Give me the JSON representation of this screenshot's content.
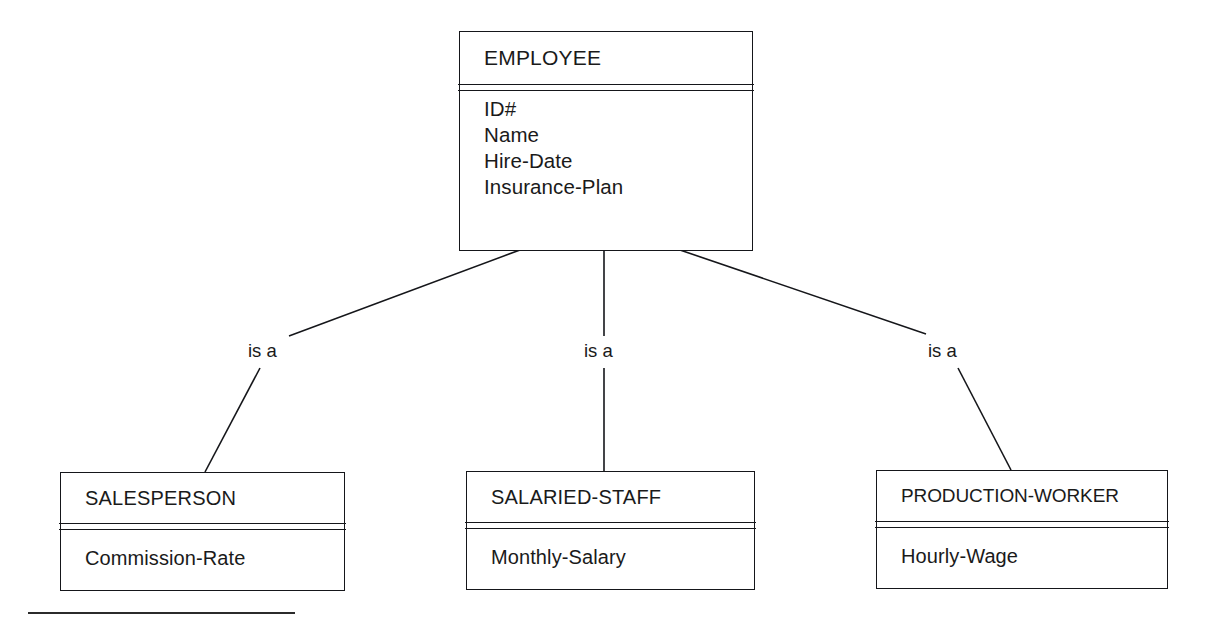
{
  "diagram": {
    "supertype": {
      "name": "EMPLOYEE",
      "attributes": [
        "ID#",
        "Name",
        "Hire-Date",
        "Insurance-Plan"
      ]
    },
    "relationship_label": "is a",
    "subtypes": [
      {
        "name": "SALESPERSON",
        "attributes": [
          "Commission-Rate"
        ],
        "relationship_label": "is a"
      },
      {
        "name": "SALARIED-STAFF",
        "attributes": [
          "Monthly-Salary"
        ],
        "relationship_label": "is a"
      },
      {
        "name": "PRODUCTION-WORKER",
        "attributes": [
          "Hourly-Wage"
        ],
        "relationship_label": "is a"
      }
    ]
  },
  "style": {
    "line_color": "#15161a",
    "text_color": "#1a1a1a",
    "background": "#ffffff"
  }
}
